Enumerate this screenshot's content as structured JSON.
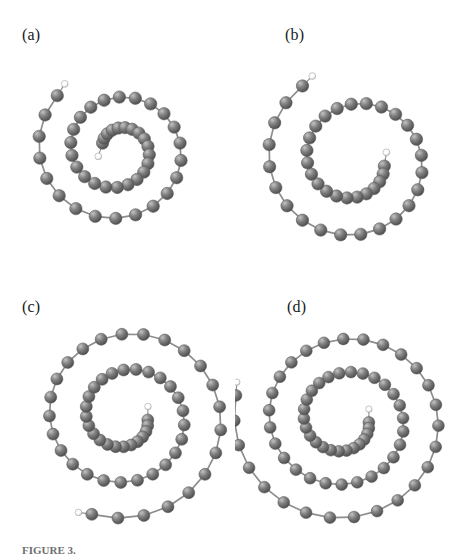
{
  "figure": {
    "background_color": "#ffffff",
    "caption_partial": "FIGURE 3.",
    "atom_colors": {
      "carbon_base": "#808080",
      "carbon_highlight": "#c2c2c2",
      "carbon_shadow": "#4a4a4a",
      "carbon_outline": "#5a5a5a",
      "hydrogen_base": "#fdfdfd",
      "hydrogen_highlight": "#ffffff",
      "hydrogen_shadow": "#c8c8c8",
      "hydrogen_outline": "#9a9a9a",
      "bond_color": "#8d8d8d"
    },
    "legend": {
      "carbon_label": "carbon",
      "hydrogen_label": "hydrogen"
    },
    "panels": [
      {
        "id": "a",
        "label": "(a)",
        "description": "spiral carbon chain, two turns, compact",
        "structure": {
          "type": "archimedean-spiral",
          "atom_count": 46,
          "carbon_radius": 6.2,
          "hydrogen_radius": 3.4,
          "center_x": 118,
          "center_y": 150,
          "start_radius": 17,
          "end_radius": 83,
          "start_angle_deg": 205,
          "turns": 2.05,
          "squash_y": 0.96,
          "rotate_deg": 0,
          "terminal_h_start": true,
          "terminal_h_end": true
        }
      },
      {
        "id": "b",
        "label": "(b)",
        "description": "open spiral carbon chain, one and a half turns",
        "structure": {
          "type": "archimedean-spiral",
          "atom_count": 40,
          "carbon_radius": 6.2,
          "hydrogen_radius": 3.4,
          "center_x": 120,
          "center_y": 160,
          "start_radius": 30,
          "end_radius": 92,
          "start_angle_deg": 12,
          "turns": 1.62,
          "squash_y": 0.98,
          "rotate_deg": 0,
          "terminal_h_start": true,
          "terminal_h_end": true
        }
      },
      {
        "id": "c",
        "label": "(c)",
        "description": "spiral carbon chain, two and a quarter turns, extended tail",
        "structure": {
          "type": "archimedean-spiral",
          "atom_count": 58,
          "carbon_radius": 6.0,
          "hydrogen_radius": 3.3,
          "center_x": 126,
          "center_y": 145,
          "start_radius": 22,
          "end_radius": 106,
          "start_angle_deg": 8,
          "turns": 2.28,
          "squash_y": 0.97,
          "rotate_deg": 0,
          "terminal_h_start": true,
          "terminal_h_end": true
        }
      },
      {
        "id": "d",
        "label": "(d)",
        "description": "longest spiral carbon chain, two and a half turns",
        "structure": {
          "type": "archimedean-spiral",
          "atom_count": 68,
          "carbon_radius": 5.9,
          "hydrogen_radius": 3.2,
          "center_x": 110,
          "center_y": 148,
          "start_radius": 24,
          "end_radius": 112,
          "start_angle_deg": 6,
          "turns": 2.52,
          "squash_y": 0.96,
          "rotate_deg": 0,
          "terminal_h_start": true,
          "terminal_h_end": true
        }
      }
    ]
  }
}
